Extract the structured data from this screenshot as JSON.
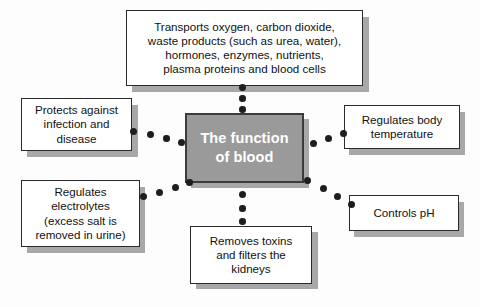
{
  "diagram": {
    "title": "The function of blood",
    "center": {
      "id": "center-node",
      "text": "The function\nof blood",
      "fill": "#9a9a9a",
      "border": "#3b3b3b",
      "text_color": "#ffffff"
    },
    "background_color": "#fdfdfd",
    "node_fill": "#ffffff",
    "node_border": "#2b2b2b",
    "shadow_color": "#a8a8a8",
    "dot_color": "#1e1e1e",
    "nodes": [
      {
        "id": "node-transports",
        "name": "transports-box",
        "text": "Transports oxygen, carbon dioxide,\nwaste products (such as urea, water),\nhormones, enzymes, nutrients,\nplasma proteins and blood cells",
        "position": "top"
      },
      {
        "id": "node-protects",
        "name": "protects-box",
        "text": "Protects against\ninfection and\ndisease",
        "position": "left-upper"
      },
      {
        "id": "node-electrolytes",
        "name": "electrolytes-box",
        "text": "Regulates\nelectrolytes\n(excess salt is\nremoved in urine)",
        "position": "left-lower"
      },
      {
        "id": "node-temperature",
        "name": "temperature-box",
        "text": "Regulates body\ntemperature",
        "position": "right-upper"
      },
      {
        "id": "node-ph",
        "name": "ph-box",
        "text": "Controls pH",
        "position": "right-lower"
      },
      {
        "id": "node-toxins",
        "name": "toxins-box",
        "text": "Removes toxins\nand filters the\nkidneys",
        "position": "bottom"
      }
    ],
    "connectors": [
      {
        "name": "connector-top",
        "dot_count": 3
      },
      {
        "name": "connector-left-upper",
        "dot_count": 4
      },
      {
        "name": "connector-left-lower",
        "dot_count": 4
      },
      {
        "name": "connector-right-upper",
        "dot_count": 3
      },
      {
        "name": "connector-right-lower",
        "dot_count": 4
      },
      {
        "name": "connector-bottom",
        "dot_count": 3
      }
    ]
  }
}
